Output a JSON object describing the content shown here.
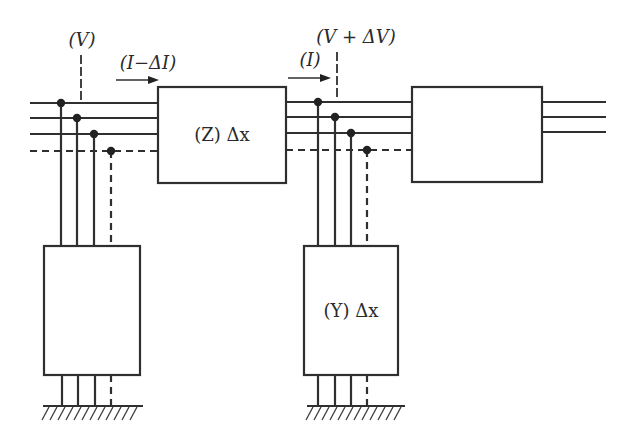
{
  "diagram": {
    "type": "circuit-schematic",
    "labels": {
      "voltage_left": "(V)",
      "current_left": "(I−ΔI)",
      "voltage_right": "(V + ΔV)",
      "current_right": "(I)",
      "series_block": "(Z) Δx",
      "shunt_block": "(Y) Δx"
    },
    "blocks": [
      {
        "id": "shunt-left",
        "label": ""
      },
      {
        "id": "series-impedance",
        "label": "(Z) Δx"
      },
      {
        "id": "shunt-middle",
        "label": "(Y) Δx"
      },
      {
        "id": "next-section",
        "label": ""
      }
    ],
    "conductors": {
      "solid_count": 3,
      "dashed_count": 1
    },
    "colors": {
      "line": "#2f2f2f",
      "background": "#ffffff"
    }
  }
}
